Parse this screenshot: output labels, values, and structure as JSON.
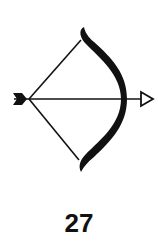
{
  "card": {
    "icon": "bow-and-arrow-icon",
    "number": "27"
  },
  "colors": {
    "ink": "#111111",
    "background": "#ffffff"
  }
}
